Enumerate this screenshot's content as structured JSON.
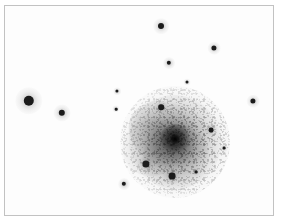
{
  "figure": {
    "name": "astronomical-image",
    "kind": "inverted-grayscale-sky-image",
    "caption": "",
    "background_color": "#ffffff",
    "frame": {
      "border_color": "#c2c2c2",
      "x": 4,
      "y": 5,
      "width": 270,
      "height": 211
    }
  },
  "sky": {
    "background_color": "#fdfdfd",
    "polarity": "inverted (stars and nebulosity appear dark on white)",
    "object_color": "#0d0d0d"
  },
  "galaxy": {
    "name": "spiral-galaxy",
    "center_x": 175,
    "center_y": 142,
    "halo_radius": 55,
    "disk_radius": 46,
    "core_radius": 15,
    "nucleus_radius": 6,
    "disk_rotation_deg": -18,
    "morphology": "face-on spiral with mottled knotty disk and bright compact nucleus",
    "arms": [
      {
        "name": "arm-north-west",
        "rotation_deg": 28
      },
      {
        "name": "arm-south-east",
        "rotation_deg": -38
      },
      {
        "name": "arm-south-west",
        "rotation_deg": 58
      }
    ]
  },
  "stars": [
    {
      "name": "star-bright-west",
      "x": 29,
      "y": 101,
      "radius": 5.2
    },
    {
      "name": "star-west-lower",
      "x": 62,
      "y": 113,
      "radius": 3.2
    },
    {
      "name": "star-north-center",
      "x": 161,
      "y": 26,
      "radius": 3.0
    },
    {
      "name": "star-north-east",
      "x": 214,
      "y": 48,
      "radius": 2.6
    },
    {
      "name": "star-upper-center",
      "x": 169,
      "y": 63,
      "radius": 2.2
    },
    {
      "name": "star-faint-upper-right",
      "x": 187,
      "y": 82,
      "radius": 1.5
    },
    {
      "name": "star-east-edge",
      "x": 253,
      "y": 101,
      "radius": 2.6
    },
    {
      "name": "star-galaxy-north",
      "x": 161,
      "y": 107,
      "radius": 2.8
    },
    {
      "name": "star-faint-west-a",
      "x": 117,
      "y": 91,
      "radius": 1.6
    },
    {
      "name": "star-faint-west-b",
      "x": 116,
      "y": 109,
      "radius": 1.3
    },
    {
      "name": "star-galaxy-east",
      "x": 211,
      "y": 130,
      "radius": 2.4
    },
    {
      "name": "star-faint-east-lower",
      "x": 224,
      "y": 148,
      "radius": 1.4
    },
    {
      "name": "star-galaxy-south-west",
      "x": 146,
      "y": 164,
      "radius": 3.6
    },
    {
      "name": "star-galaxy-south",
      "x": 172,
      "y": 176,
      "radius": 3.4
    },
    {
      "name": "star-faint-south-east",
      "x": 196,
      "y": 172,
      "radius": 1.4
    },
    {
      "name": "star-south-west-outer",
      "x": 124,
      "y": 184,
      "radius": 2.2
    }
  ]
}
